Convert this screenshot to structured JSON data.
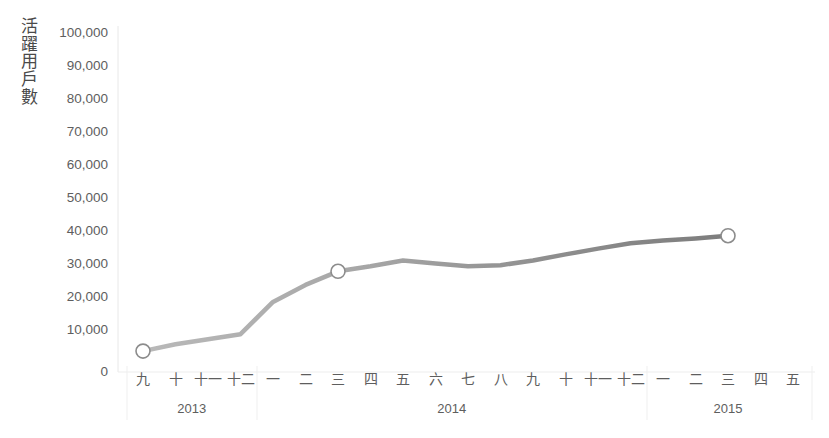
{
  "chart_data": {
    "type": "line",
    "title": "",
    "xlabel": "",
    "ylabel": "活躍用戶數",
    "ylim": [
      0,
      100000
    ],
    "yticks": [
      0,
      10000,
      20000,
      30000,
      40000,
      50000,
      60000,
      70000,
      80000,
      90000,
      100000
    ],
    "ytick_labels": [
      "0",
      "10,000",
      "20,000",
      "30,000",
      "40,000",
      "50,000",
      "60,000",
      "70,000",
      "80,000",
      "90,000",
      "100,000"
    ],
    "grid": false,
    "legend": "none",
    "line_color": "#8c8c8c",
    "marker_color": "#ffffff",
    "marker_edge_color": "#8c8c8c",
    "categories": [
      "九",
      "十",
      "十一",
      "十二",
      "一",
      "二",
      "三",
      "四",
      "五",
      "六",
      "七",
      "八",
      "九",
      "十",
      "十一",
      "十二",
      "一",
      "二",
      "三",
      "四",
      "五"
    ],
    "group_labels": [
      "2013",
      "2014",
      "2015"
    ],
    "group_spans": [
      {
        "label": "2013",
        "start": 0,
        "end": 3
      },
      {
        "label": "2014",
        "start": 4,
        "end": 15
      },
      {
        "label": "2015",
        "start": 16,
        "end": 20
      }
    ],
    "values": [
      6000,
      8000,
      9500,
      11000,
      20500,
      25500,
      29500,
      31000,
      32700,
      31800,
      31000,
      31300,
      32700,
      34500,
      36200,
      37800,
      38600,
      39200,
      40000,
      null,
      null
    ],
    "marked_points": [
      {
        "index": 0,
        "category": "九",
        "year": "2013",
        "value": 6000
      },
      {
        "index": 6,
        "category": "三",
        "year": "2014",
        "value": 29500
      },
      {
        "index": 18,
        "category": "三",
        "year": "2015",
        "value": 40000
      }
    ]
  },
  "axes": {
    "y_axis_line_color": "#e8e8e8",
    "x_axis_line_color": "#e8e8e8",
    "separator_color": "#ededed"
  }
}
